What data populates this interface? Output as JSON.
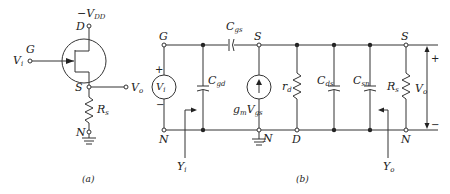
{
  "figure_a": {
    "caption": "(a)",
    "supply": "−V",
    "supply_sub": "DD",
    "drain": "D",
    "gate": "G",
    "input": "V",
    "input_sub": "i",
    "source": "S",
    "output": "V",
    "output_sub": "o",
    "resistor": "R",
    "resistor_sub": "s",
    "ground_node": "N"
  },
  "figure_b": {
    "caption": "(b)",
    "gate": "G",
    "source_top": "S",
    "source_right": "S",
    "node_left": "N",
    "node_mid": "N",
    "node_right": "N",
    "drain": "D",
    "vsrc": "V",
    "vsrc_sub": "i",
    "vsrc_plus": "+",
    "vsrc_minus": "−",
    "cgs": "C",
    "cgs_sub": "gs",
    "cgd": "C",
    "cgd_sub": "gd",
    "gm": "g",
    "gm_sub": "m",
    "vgs": "V",
    "vgs_sub": "gs",
    "rd": "r",
    "rd_sub": "d",
    "cds": "C",
    "cds_sub": "ds",
    "csn": "C",
    "csn_sub": "sn",
    "rs": "R",
    "rs_sub": "s",
    "vo": "V",
    "vo_sub": "o",
    "vo_plus": "+",
    "vo_minus": "−",
    "yi": "Y",
    "yi_sub": "i",
    "yo": "Y",
    "yo_sub": "o"
  }
}
